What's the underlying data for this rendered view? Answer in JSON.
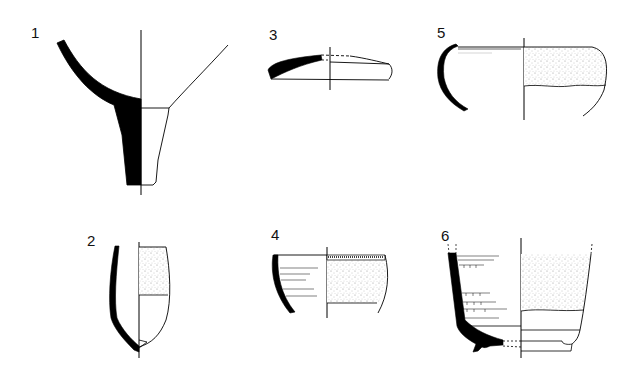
{
  "figure": {
    "type": "pottery-profile-plate",
    "background": "#ffffff",
    "ink": "#000000",
    "stipple": "#9a9a9a",
    "items": [
      {
        "number": "1",
        "description": "pedestal base of cup/bowl, section left, exterior right"
      },
      {
        "number": "2",
        "description": "beaker profile with stippled exterior band"
      },
      {
        "number": "3",
        "description": "shallow lid / dish profile"
      },
      {
        "number": "4",
        "description": "bowl with incised lines and stippled exterior"
      },
      {
        "number": "5",
        "description": "hemispherical bowl with stippled upper exterior"
      },
      {
        "number": "6",
        "description": "ring-footed bowl with incised grooves and stippled exterior"
      }
    ]
  }
}
